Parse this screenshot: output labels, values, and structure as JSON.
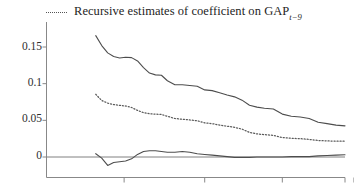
{
  "chart_data": {
    "type": "line",
    "title": "",
    "subtitle": "",
    "xlabel": "",
    "ylabel": "",
    "grid": false,
    "legend_position": "top-left",
    "ylim": [
      -0.018,
      0.178
    ],
    "yticks": [
      0,
      0.05,
      0.1,
      0.15
    ],
    "ytick_labels": [
      "0",
      "0.05",
      "0.1",
      "0.15"
    ],
    "xlim": [
      0,
      100
    ],
    "xticks": [
      26,
      53,
      79,
      103
    ],
    "xtick_labels": [
      "",
      "",
      "",
      ""
    ],
    "reference_lines": [
      {
        "name": "zero-line",
        "y": 0,
        "style": "solid"
      }
    ],
    "series": [
      {
        "name": "upper-confidence-band",
        "style": "solid",
        "color": "#4d4d4d",
        "x": [
          16.5,
          18.5,
          20.5,
          22.5,
          24.5,
          26.5,
          28.5,
          30.5,
          32.5,
          34.5,
          36.5,
          38.5,
          40.5,
          43.0,
          45.5,
          48.0,
          50.5,
          53.0,
          55.5,
          58.0,
          60.5,
          63.0,
          65.5,
          68.0,
          70.5,
          73.0,
          76.0,
          79.0,
          82.0,
          85.0,
          88.0,
          91.0,
          94.0,
          97.0,
          100.0
        ],
        "values": [
          0.1655,
          0.152,
          0.142,
          0.137,
          0.135,
          0.136,
          0.1355,
          0.131,
          0.122,
          0.1145,
          0.112,
          0.1115,
          0.104,
          0.0985,
          0.0985,
          0.0975,
          0.0965,
          0.0915,
          0.0905,
          0.0875,
          0.0845,
          0.082,
          0.0775,
          0.0705,
          0.068,
          0.0665,
          0.0655,
          0.0585,
          0.0555,
          0.0545,
          0.0525,
          0.0475,
          0.0455,
          0.0435,
          0.0425
        ]
      },
      {
        "name": "point-estimate",
        "style": "dotted",
        "color": "#5a5a5a",
        "x": [
          16.5,
          18.5,
          20.5,
          22.5,
          24.5,
          26.5,
          28.5,
          30.5,
          32.5,
          34.5,
          36.5,
          38.5,
          40.5,
          43.0,
          45.5,
          48.0,
          50.5,
          53.0,
          55.5,
          58.0,
          60.5,
          63.0,
          65.5,
          68.0,
          70.5,
          73.0,
          76.0,
          79.0,
          82.0,
          85.0,
          88.0,
          91.0,
          94.0,
          97.0,
          100.0
        ],
        "values": [
          0.0855,
          0.077,
          0.0735,
          0.0715,
          0.0705,
          0.0695,
          0.0675,
          0.0635,
          0.0605,
          0.059,
          0.0585,
          0.058,
          0.0555,
          0.0525,
          0.0515,
          0.0505,
          0.0495,
          0.0465,
          0.0455,
          0.0435,
          0.042,
          0.0405,
          0.038,
          0.0335,
          0.0315,
          0.0305,
          0.0295,
          0.0265,
          0.0255,
          0.025,
          0.024,
          0.0225,
          0.022,
          0.0215,
          0.0215
        ]
      },
      {
        "name": "lower-confidence-band",
        "style": "solid",
        "color": "#4d4d4d",
        "x": [
          16.5,
          18.5,
          20.5,
          22.5,
          24.5,
          26.5,
          28.5,
          30.5,
          32.5,
          34.5,
          36.5,
          38.5,
          40.5,
          43.0,
          45.5,
          48.0,
          50.5,
          53.0,
          55.5,
          58.0,
          60.5,
          63.0,
          65.5,
          68.0,
          70.5,
          73.0,
          76.0,
          79.0,
          82.0,
          85.0,
          88.0,
          91.0,
          94.0,
          97.0,
          100.0
        ],
        "values": [
          0.0045,
          -0.0015,
          -0.0115,
          -0.0075,
          -0.0065,
          -0.0055,
          -0.0025,
          0.0035,
          0.0075,
          0.0085,
          0.0085,
          0.0075,
          0.0065,
          0.0065,
          0.0075,
          0.0065,
          0.0045,
          0.0035,
          0.0025,
          0.0015,
          0.0005,
          -0.0005,
          -0.0005,
          -0.0005,
          0.0,
          0.0,
          0.0,
          0.0,
          0.0005,
          0.0005,
          0.0005,
          0.0015,
          0.002,
          0.0025,
          0.003
        ]
      }
    ]
  },
  "legend": {
    "entries": [
      {
        "label_prefix": "Recursive estimates of coefficient on GAP",
        "label_subscript": "t−9",
        "style": "dotted"
      }
    ]
  },
  "axes": {
    "y_tick_labels": [
      "0.15",
      "0.1",
      "0.05",
      "0"
    ],
    "x_tick_labels": [
      "",
      "",
      "",
      ""
    ]
  },
  "colors": {
    "line": "#4d4d4d",
    "dotted": "#5a5a5a",
    "axis": "#7a7a7a",
    "zero_line": "#808080",
    "text": "#242424",
    "background": "#ffffff"
  }
}
